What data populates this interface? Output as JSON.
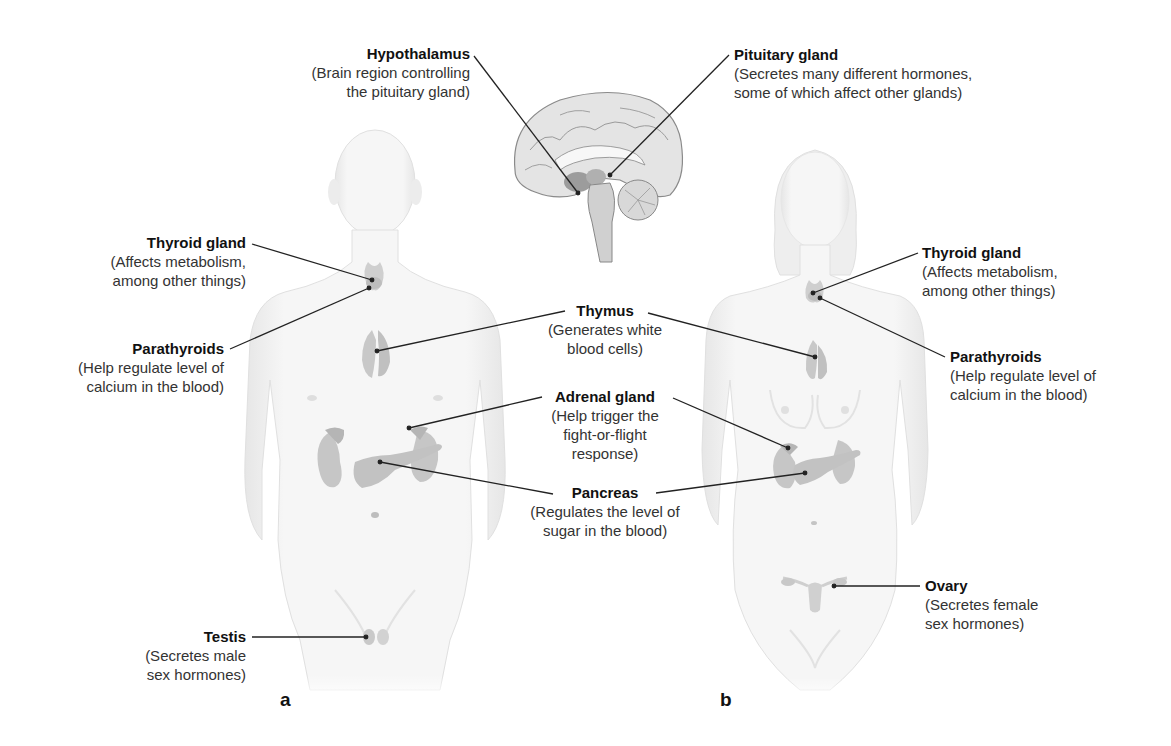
{
  "figure": {
    "panels": [
      {
        "id": "a",
        "label": "a",
        "subject": "male body"
      },
      {
        "id": "b",
        "label": "b",
        "subject": "female body"
      }
    ],
    "labels": {
      "hypothalamus": {
        "title": "Hypothalamus",
        "line1": "(Brain region controlling",
        "line2": "the pituitary gland)"
      },
      "pituitary": {
        "title": "Pituitary gland",
        "line1": "(Secretes many different hormones,",
        "line2": "some of which affect other glands)"
      },
      "thyroid_a": {
        "title": "Thyroid gland",
        "line1": "(Affects metabolism,",
        "line2": "among other things)"
      },
      "parathyroids_a": {
        "title": "Parathyroids",
        "line1": "(Help regulate level of",
        "line2": "calcium in the blood)"
      },
      "thymus": {
        "title": "Thymus",
        "line1": "(Generates white",
        "line2": "blood cells)"
      },
      "adrenal": {
        "title": "Adrenal gland",
        "line1": "(Help trigger the",
        "line2": "fight-or-flight",
        "line3": "response)"
      },
      "pancreas": {
        "title": "Pancreas",
        "line1": "(Regulates the level of",
        "line2": "sugar in the blood)"
      },
      "testis": {
        "title": "Testis",
        "line1": "(Secretes male",
        "line2": "sex hormones)"
      },
      "thyroid_b": {
        "title": "Thyroid gland",
        "line1": "(Affects metabolism,",
        "line2": "among other things)"
      },
      "parathyroids_b": {
        "title": "Parathyroids",
        "line1": "(Help regulate level of",
        "line2": "calcium in the blood)"
      },
      "ovary": {
        "title": "Ovary",
        "line1": "(Secretes female",
        "line2": "sex hormones)"
      }
    },
    "colors": {
      "body_fill": "#f2f2f2",
      "body_edge": "#dcdcdc",
      "organ_fill": "#c4c4c4",
      "organ_dark": "#a8a8a8",
      "leader_line": "#222222",
      "text": "#1a1a1a"
    }
  }
}
